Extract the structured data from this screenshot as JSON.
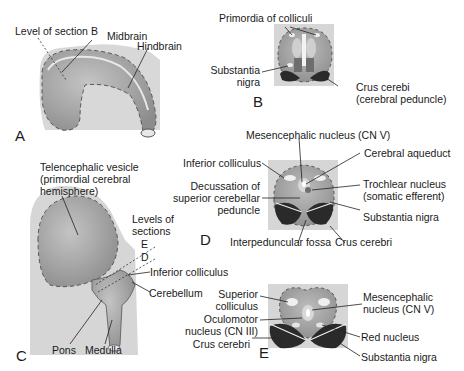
{
  "figure": {
    "panels": {
      "A": {
        "letter": "A",
        "labels": {
          "level_of_section_b": "Level of section B",
          "midbrain": "Midbrain",
          "hindbrain": "Hindbrain"
        }
      },
      "B": {
        "letter": "B",
        "labels": {
          "primordia_of_colliculi": "Primordia of colliculi",
          "substantia_nigra_1": "Substantia",
          "substantia_nigra_2": "nigra",
          "crus_cerebri_1": "Crus cerebi",
          "crus_cerebri_2": "(cerebral peduncle)"
        }
      },
      "C": {
        "letter": "C",
        "labels": {
          "telencephalic_1": "Telencephalic vesicle",
          "telencephalic_2": "(primordial cerebral",
          "telencephalic_3": "hemisphere)",
          "levels_1": "Levels of",
          "levels_2": "sections",
          "level_e": "E",
          "level_d": "D",
          "inferior_colliculus": "Inferior colliculus",
          "cerebellum": "Cerebellum",
          "pons": "Pons",
          "medulla": "Medulla"
        }
      },
      "D": {
        "letter": "D",
        "labels": {
          "mesencephalic_nucleus": "Mesencephalic nucleus (CN V)",
          "inferior_colliculus": "Inferior colliculus",
          "cerebral_aqueduct": "Cerebral aqueduct",
          "decussation_1": "Decussation of",
          "decussation_2": "superior cerebellar",
          "decussation_3": "peduncle",
          "trochlear_1": "Trochlear nucleus",
          "trochlear_2": "(somatic efferent)",
          "substantia_nigra": "Substantia nigra",
          "interpeduncular_fossa": "Interpeduncular fossa",
          "crus_cerebri": "Crus cerebri"
        }
      },
      "E": {
        "letter": "E",
        "labels": {
          "superior_colliculus_1": "Superior",
          "superior_colliculus_2": "colliculus",
          "oculomotor_1": "Oculomotor",
          "oculomotor_2": "nucleus (CN III)",
          "crus_cerebri": "Crus cerebri",
          "mesencephalic_1": "Mesencephalic",
          "mesencephalic_2": "nucleus (CN V)",
          "red_nucleus": "Red nucleus",
          "substantia_nigra": "Substantia nigra"
        }
      }
    },
    "colors": {
      "background_box": "#d6d6d6",
      "tissue": "#9a9a9a",
      "tissue_light": "#b8b8b8",
      "dark_crus": "#2a2a2a",
      "outline": "#3a3a3a"
    }
  }
}
